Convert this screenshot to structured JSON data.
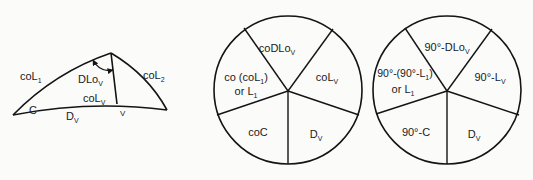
{
  "triangle": {
    "labels": {
      "col1": {
        "main": "coL",
        "sub": "1"
      },
      "col2": {
        "main": "coL",
        "sub": "2"
      },
      "dlov": {
        "main": "DLo",
        "sub": "V"
      },
      "colv": {
        "main": "coL",
        "sub": "V"
      },
      "c": "C",
      "dv": {
        "main": "D",
        "sub": "V"
      },
      "v": "V"
    }
  },
  "napier_circle_1": {
    "parts": [
      {
        "id": "top",
        "text": "coDLo",
        "sub": "V"
      },
      {
        "id": "right",
        "text": "coL",
        "sub": "V"
      },
      {
        "id": "bottom-right",
        "text": "D",
        "sub": "V"
      },
      {
        "id": "bottom-left",
        "text": "coC"
      },
      {
        "id": "left-line1",
        "text": "co (coL",
        "sub": "1",
        "tail": ")"
      },
      {
        "id": "left-line2",
        "text": "or L",
        "sub": "1"
      }
    ]
  },
  "napier_circle_2": {
    "parts": [
      {
        "id": "top",
        "text": "90°-DLo",
        "sub": "V"
      },
      {
        "id": "right",
        "text": "90°-L",
        "sub": "V"
      },
      {
        "id": "bottom-right",
        "text": "D",
        "sub": "V"
      },
      {
        "id": "bottom-left",
        "text": "90°-C"
      },
      {
        "id": "left-line1",
        "text": "90°-(90°-L",
        "sub": "1",
        "tail": ")"
      },
      {
        "id": "left-line2",
        "text": "or L",
        "sub": "1"
      }
    ]
  }
}
